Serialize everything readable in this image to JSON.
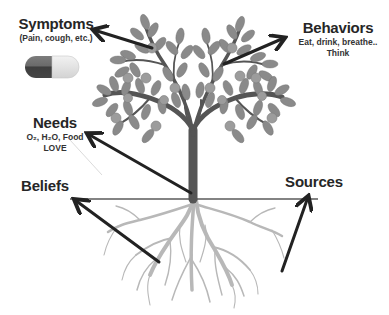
{
  "diagram": {
    "type": "tree-metaphor",
    "labels": {
      "symptoms": {
        "title": "Symptoms",
        "subtitle": "(Pain, cough, etc.)"
      },
      "behaviors": {
        "title": "Behaviors",
        "line1": "Eat, drink, breathe..",
        "line2": "Think"
      },
      "needs": {
        "title": "Needs",
        "line1": "O₂, H₂O, Food",
        "line2": "LOVE"
      },
      "beliefs": {
        "title": "Beliefs"
      },
      "sources": {
        "title": "Sources"
      }
    },
    "icons": {
      "pill": "pill-capsule-icon",
      "tree": "tree-illustration",
      "roots": "roots-illustration"
    },
    "colors": {
      "arrow": "#222222",
      "trunk": "#555555",
      "leaf": "#8a8a8a",
      "leaf_dark": "#6f6f6f",
      "fruit": "#9a9a9a",
      "roots": "#b5b5b5",
      "ground_line": "#555555",
      "pill_dark": "#4a4a4a",
      "pill_mid": "#7a7a7a",
      "pill_light": "#e2e2e2"
    }
  }
}
